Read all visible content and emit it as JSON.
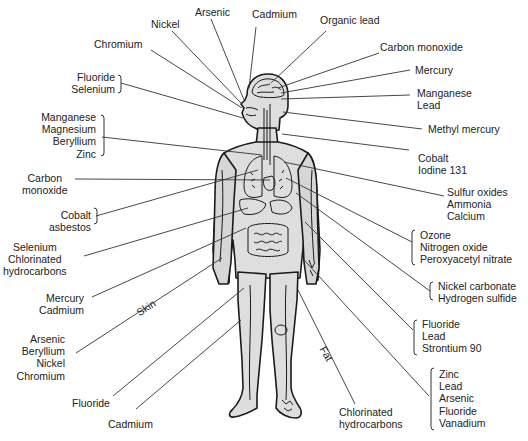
{
  "diagram": {
    "colors": {
      "body_fill": "#dedede",
      "outline": "#1a1a1a",
      "leader": "#333333",
      "text": "#222222"
    },
    "labels": {
      "nickel": {
        "lines": [
          "Nickel"
        ]
      },
      "arsenic_top": {
        "lines": [
          "Arsenic"
        ]
      },
      "cadmium_top": {
        "lines": [
          "Cadmium"
        ]
      },
      "organic_lead": {
        "lines": [
          "Organic lead"
        ]
      },
      "chromium": {
        "lines": [
          "Chromium"
        ]
      },
      "carbon_monoxide_top": {
        "lines": [
          "Carbon monoxide"
        ]
      },
      "fluoride_selenium": {
        "lines": [
          "Fluoride",
          "Selenium"
        ]
      },
      "mercury_top": {
        "lines": [
          "Mercury"
        ]
      },
      "manganese_lead": {
        "lines": [
          "Manganese",
          "Lead"
        ]
      },
      "manganese_group": {
        "lines": [
          "Manganese",
          "Magnesium",
          "Beryllium",
          "Zinc"
        ]
      },
      "methyl_mercury": {
        "lines": [
          "Methyl mercury"
        ]
      },
      "cobalt_iodine": {
        "lines": [
          "Cobalt",
          "Iodine 131"
        ]
      },
      "carbon_monoxide_left": {
        "lines": [
          "Carbon",
          "monoxide"
        ]
      },
      "sulfur_group": {
        "lines": [
          "Sulfur oxides",
          "Ammonia",
          "Calcium"
        ]
      },
      "cobalt_asbestos": {
        "lines": [
          "Cobalt",
          "asbestos"
        ]
      },
      "ozone_group": {
        "lines": [
          "Ozone",
          "Nitrogen oxide",
          "Peroxyacetyl nitrate"
        ]
      },
      "selenium_chlorinated": {
        "lines": [
          "Selenium",
          "Chlorinated",
          "hydrocarbons"
        ]
      },
      "nickel_carbonate_group": {
        "lines": [
          "Nickel carbonate",
          "Hydrogen sulfide"
        ]
      },
      "mercury_cadmium": {
        "lines": [
          "Mercury",
          "Cadmium"
        ]
      },
      "skin": {
        "lines": [
          "Skin"
        ]
      },
      "fluoride_lead_strontium": {
        "lines": [
          "Fluoride",
          "Lead",
          "Strontium 90"
        ]
      },
      "arsenic_group": {
        "lines": [
          "Arsenic",
          "Beryllium",
          "Nickel",
          "Chromium"
        ]
      },
      "fat": {
        "lines": [
          "Fat"
        ]
      },
      "zinc_group": {
        "lines": [
          "Zinc",
          "Lead",
          "Arsenic",
          "Fluoride",
          "Vanadium"
        ]
      },
      "fluoride_bottom": {
        "lines": [
          "Fluoride"
        ]
      },
      "cadmium_bottom": {
        "lines": [
          "Cadmium"
        ]
      },
      "chlorinated_bottom": {
        "lines": [
          "Chlorinated",
          "hydrocarbons"
        ]
      }
    }
  }
}
